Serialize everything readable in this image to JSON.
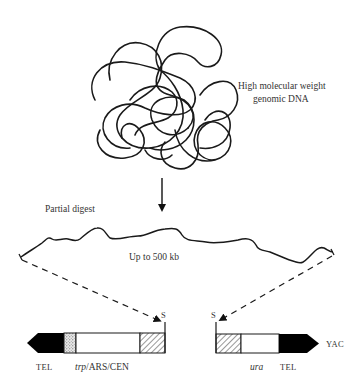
{
  "diagram": {
    "genomic_dna_label_line1": "High molecular weight",
    "genomic_dna_label_line2": "genomic DNA",
    "step_label": "Partial digest",
    "fragment_label": "Up to 500 kb",
    "left_arm": {
      "site_label": "S",
      "labels": {
        "tel": "TEL",
        "marker_italic": "trp",
        "marker_rest": "/ARS/CEN"
      },
      "segments": [
        "TEL (black arrow)",
        "stippled",
        "white",
        "hatched"
      ]
    },
    "right_arm": {
      "site_label": "S",
      "labels": {
        "marker_italic": "ura",
        "tel": "TEL"
      },
      "segments": [
        "hatched",
        "white",
        "TEL (black arrow)"
      ]
    },
    "vector_label": "YAC",
    "colors": {
      "line": "#1a1a1a",
      "text": "#333333",
      "fill_black": "#000000",
      "background": "#ffffff"
    }
  }
}
